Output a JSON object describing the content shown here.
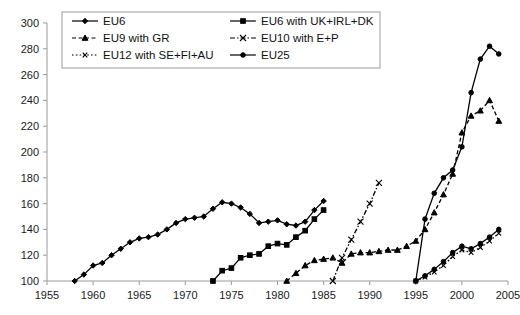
{
  "chart_data": {
    "type": "line",
    "title": "",
    "xlabel": "",
    "ylabel": "",
    "xlim": [
      1955,
      2005
    ],
    "ylim": [
      100,
      300
    ],
    "xticks": [
      1955,
      1960,
      1965,
      1970,
      1975,
      1980,
      1985,
      1990,
      1995,
      2000,
      2005
    ],
    "yticks": [
      100,
      120,
      140,
      160,
      180,
      200,
      220,
      240,
      260,
      280,
      300
    ],
    "grid": false,
    "legend_position": "top-left",
    "series": [
      {
        "name": "EU6",
        "marker": "filled-diamond",
        "dash": "solid",
        "x": [
          1958,
          1959,
          1960,
          1961,
          1962,
          1963,
          1964,
          1965,
          1966,
          1967,
          1968,
          1969,
          1970,
          1971,
          1972,
          1973,
          1974,
          1975,
          1976,
          1977,
          1978,
          1979,
          1980,
          1981,
          1982,
          1983,
          1984,
          1985
        ],
        "y": [
          100,
          105,
          112,
          114,
          120,
          125,
          130,
          133,
          134,
          136,
          140,
          145,
          148,
          149,
          150,
          156,
          161,
          160,
          157,
          152,
          145,
          146,
          147,
          144,
          143,
          146,
          155,
          162
        ]
      },
      {
        "name": "EU6 with UK+IRL+DK",
        "marker": "filled-square",
        "dash": "solid",
        "x": [
          1973,
          1974,
          1975,
          1976,
          1977,
          1978,
          1979,
          1980,
          1981,
          1982,
          1983,
          1984,
          1985
        ],
        "y": [
          100,
          108,
          110,
          118,
          120,
          121,
          127,
          129,
          128,
          134,
          139,
          148,
          155
        ]
      },
      {
        "name": "EU9 with GR",
        "marker": "filled-triangle",
        "dash": "dashed",
        "x": [
          1981,
          1982,
          1983,
          1984,
          1985,
          1986,
          1987,
          1988,
          1989,
          1990,
          1991,
          1992,
          1993,
          1994,
          1995,
          1996,
          1997,
          1998,
          1999,
          2000,
          2001,
          2002,
          2003,
          2004
        ],
        "y": [
          100,
          106,
          112,
          116,
          117,
          118,
          114,
          121,
          122,
          122,
          123,
          124,
          124,
          127,
          131,
          140,
          153,
          167,
          183,
          215,
          228,
          232,
          240,
          224
        ]
      },
      {
        "name": "EU10 with E+P",
        "marker": "cross-x",
        "dash": "dashdot",
        "x": [
          1986,
          1987,
          1988,
          1989,
          1990,
          1991
        ],
        "y": [
          100,
          118,
          132,
          146,
          160,
          176
        ]
      },
      {
        "name": "EU12 with SE+FI+AU",
        "marker": "small-x",
        "dash": "dotted",
        "x": [
          1995,
          1996,
          1997,
          1998,
          1999,
          2000,
          2001,
          2002,
          2003,
          2004
        ],
        "y": [
          100,
          103,
          107,
          112,
          119,
          124,
          122,
          126,
          131,
          137
        ]
      },
      {
        "name": "EU25",
        "marker": "filled-circle",
        "dash": "solid",
        "x": [
          1995,
          1996,
          1997,
          1998,
          1999,
          2000,
          2001,
          2002,
          2003,
          2004
        ],
        "y": [
          100,
          104,
          109,
          115,
          122,
          127,
          125,
          129,
          134,
          140
        ]
      }
    ],
    "steep_series_note": "",
    "extra_series": [
      {
        "name": "EU6 with UK+IRL+DK continued",
        "marker": "filled-square",
        "dash": "solid",
        "x": [
          1995,
          1996,
          1997,
          1998,
          1999,
          2000,
          2001,
          2002,
          2003,
          2004
        ],
        "y": [
          100,
          103,
          107,
          112,
          119,
          124,
          122,
          126,
          131,
          137
        ]
      }
    ]
  },
  "legend": {
    "items": [
      {
        "label": "EU6"
      },
      {
        "label": "EU6 with UK+IRL+DK"
      },
      {
        "label": "EU9 with GR"
      },
      {
        "label": "EU10 with E+P"
      },
      {
        "label": "EU12 with SE+FI+AU"
      },
      {
        "label": "EU25"
      }
    ]
  },
  "steep": {
    "name": "EU6 with UK+IRL+DK late",
    "x": [
      1995,
      1996,
      1997,
      1998,
      1999,
      2000,
      2001,
      2002,
      2003,
      2004
    ],
    "y": [
      100,
      148,
      168,
      180,
      186,
      204,
      246,
      272,
      282,
      276
    ]
  },
  "colors": {
    "axis": "#9a9a9a",
    "ink": "#000000",
    "text": "#1a1a1a",
    "background": "#ffffff"
  }
}
